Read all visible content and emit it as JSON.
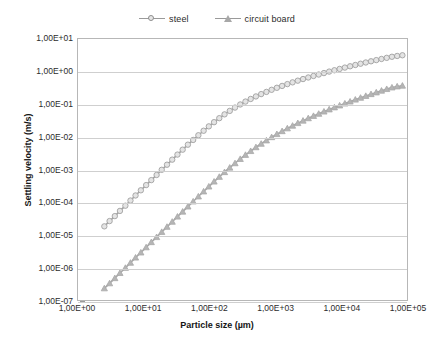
{
  "chart_data": {
    "type": "line",
    "title": "",
    "xlabel": "Particle size (µm)",
    "ylabel": "Settling velocity (m/s)",
    "xscale": "log",
    "yscale": "log",
    "xlim": [
      1,
      100000
    ],
    "ylim": [
      1e-07,
      10
    ],
    "grid": true,
    "legend_position": "top-center",
    "x_tick_labels": [
      "1,00E+00",
      "1,00E+01",
      "1,00E+02",
      "1,00E+03",
      "1,00E+04",
      "1,00E+05"
    ],
    "x_tick_values": [
      1,
      10,
      100,
      1000,
      10000,
      100000
    ],
    "y_tick_labels": [
      "1,00E+01",
      "1,00E+00",
      "1,00E-01",
      "1,00E-02",
      "1,00E-03",
      "1,00E-04",
      "1,00E-05",
      "1,00E-06",
      "1,00E-07"
    ],
    "y_tick_values": [
      10,
      1,
      0.1,
      0.01,
      0.001,
      0.0001,
      1e-05,
      1e-06,
      1e-07
    ],
    "series": [
      {
        "name": "steel",
        "marker": "circle",
        "color": "#a0a0a0",
        "marker_fill": "#e4e4e4",
        "x": [
          2.5,
          3.0,
          3.6,
          4.3,
          5.2,
          6.2,
          7.4,
          8.9,
          10.7,
          12.8,
          15.4,
          18.4,
          22.1,
          26.5,
          31.8,
          38.1,
          45.7,
          54.9,
          65.8,
          79.0,
          94.7,
          113.6,
          136.3,
          163.5,
          196.1,
          235.3,
          282.3,
          338.6,
          406.2,
          487.3,
          584.6,
          701.3,
          841.3,
          1009.3,
          1210.7,
          1452.4,
          1742.2,
          2090.1,
          2507.3,
          3007.8,
          3607.9,
          4327.9,
          5191.5,
          6227.4,
          7469.9,
          8960.3,
          10747.9,
          12892.3,
          15464.4,
          18549.3,
          22250.7,
          26690.8,
          32016.4,
          38404.3,
          46067.0,
          55258.8,
          66285.0,
          79510.0
        ],
        "y": [
          2e-05,
          2.9e-05,
          4.1e-05,
          5.9e-05,
          8.5e-05,
          0.000122,
          0.000174,
          0.00025,
          0.00036,
          0.00051,
          0.00073,
          0.00105,
          0.0015,
          0.00214,
          0.00305,
          0.0043,
          0.0061,
          0.0085,
          0.0118,
          0.0162,
          0.022,
          0.0295,
          0.039,
          0.051,
          0.065,
          0.082,
          0.102,
          0.125,
          0.15,
          0.179,
          0.211,
          0.246,
          0.285,
          0.328,
          0.374,
          0.425,
          0.48,
          0.54,
          0.605,
          0.675,
          0.75,
          0.83,
          0.92,
          1.02,
          1.12,
          1.23,
          1.35,
          1.48,
          1.62,
          1.77,
          1.93,
          2.1,
          2.28,
          2.47,
          2.67,
          2.88,
          3.05,
          3.2
        ]
      },
      {
        "name": "circuit board",
        "marker": "triangle",
        "color": "#a8a8a8",
        "marker_fill": "#b5b5b5",
        "x": [
          2.5,
          3.0,
          3.6,
          4.3,
          5.2,
          6.2,
          7.4,
          8.9,
          10.7,
          12.8,
          15.4,
          18.4,
          22.1,
          26.5,
          31.8,
          38.1,
          45.7,
          54.9,
          65.8,
          79.0,
          94.7,
          113.6,
          136.3,
          163.5,
          196.1,
          235.3,
          282.3,
          338.6,
          406.2,
          487.3,
          584.6,
          701.3,
          841.3,
          1009.3,
          1210.7,
          1452.4,
          1742.2,
          2090.1,
          2507.3,
          3007.8,
          3607.9,
          4327.9,
          5191.5,
          6227.4,
          7469.9,
          8960.3,
          10747.9,
          12892.3,
          15464.4,
          18549.3,
          22250.7,
          26690.8,
          32016.4,
          38404.3,
          46067.0,
          55258.8,
          66285.0,
          79510.0
        ],
        "y": [
          2.6e-07,
          3.7e-07,
          5.3e-07,
          7.6e-07,
          1.09e-06,
          1.56e-06,
          2.24e-06,
          3.2e-06,
          4.6e-06,
          6.6e-06,
          9.4e-06,
          1.35e-05,
          1.93e-05,
          2.76e-05,
          3.95e-05,
          5.6e-05,
          8e-05,
          0.000114,
          0.000162,
          0.00023,
          0.000325,
          0.00046,
          0.00064,
          0.00089,
          0.00122,
          0.00166,
          0.00224,
          0.00298,
          0.0039,
          0.0051,
          0.0065,
          0.0082,
          0.0103,
          0.0128,
          0.0157,
          0.0191,
          0.023,
          0.0276,
          0.0328,
          0.0388,
          0.0456,
          0.053,
          0.062,
          0.072,
          0.083,
          0.095,
          0.109,
          0.125,
          0.143,
          0.163,
          0.185,
          0.21,
          0.237,
          0.268,
          0.3,
          0.335,
          0.36,
          0.38
        ]
      }
    ]
  },
  "legend": {
    "entries": [
      {
        "label": "steel",
        "marker": "circle-marker-icon"
      },
      {
        "label": "circuit board",
        "marker": "triangle-marker-icon"
      }
    ]
  },
  "axes": {
    "x_title": "Particle size (µm)",
    "y_title": "Settling velocity (m/s)"
  },
  "colors": {
    "grid": "#cfcfcf",
    "frame": "#b7b7b7",
    "steel": "#a0a0a0",
    "circuit_board": "#a8a8a8",
    "text": "#2b2b2b",
    "background": "#ffffff"
  }
}
